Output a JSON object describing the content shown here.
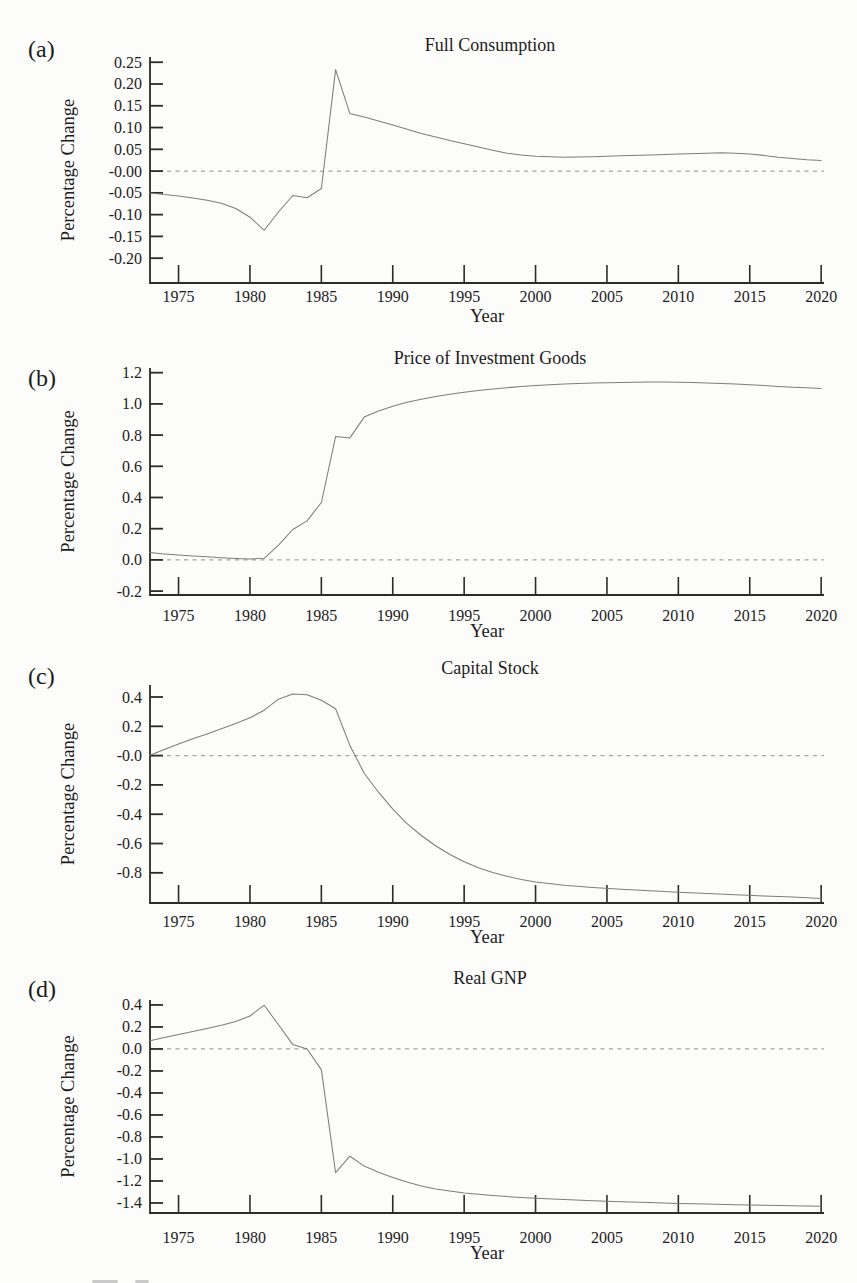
{
  "page": {
    "colors": {
      "paper": "#fcfcfb",
      "ink": "#1c1c1c",
      "axis": "#2b2b2b",
      "curve": "#7d7d7d",
      "dashed": "#a3a3a3"
    }
  },
  "chart_data": [
    {
      "type": "line",
      "id": "a",
      "panel_label": "(a)",
      "title": "Full Consumption",
      "xlabel": "Year",
      "ylabel": "Percentage Change",
      "xlim": [
        1973,
        2020.2
      ],
      "ylim": [
        -0.257,
        0.262
      ],
      "grid": false,
      "legend": false,
      "zero_dashed_line": true,
      "xticks": [
        1975,
        1980,
        1985,
        1990,
        1995,
        2000,
        2005,
        2010,
        2015,
        2020
      ],
      "xtick_labels": [
        "1975",
        "1980",
        "1985",
        "1990",
        "1995",
        "2000",
        "2005",
        "2010",
        "2015",
        "2020"
      ],
      "ytick_values": [
        0.25,
        0.2,
        0.15,
        0.1,
        0.05,
        0.0,
        -0.05,
        -0.1,
        -0.15,
        -0.2
      ],
      "ytick_labels": [
        "0.25",
        "0.20",
        "0.15",
        "0.10",
        "0.05",
        "-0.00",
        "-0.05",
        "-0.10",
        "-0.15",
        "-0.20"
      ],
      "series": [
        {
          "name": "Full Consumption",
          "points": [
            [
              1973,
              -0.05
            ],
            [
              1974,
              -0.054
            ],
            [
              1975,
              -0.057
            ],
            [
              1976,
              -0.062
            ],
            [
              1977,
              -0.067
            ],
            [
              1978,
              -0.074
            ],
            [
              1979,
              -0.086
            ],
            [
              1980,
              -0.106
            ],
            [
              1981,
              -0.136
            ],
            [
              1982,
              -0.094
            ],
            [
              1983,
              -0.056
            ],
            [
              1984,
              -0.061
            ],
            [
              1985,
              -0.04
            ],
            [
              1986,
              0.233
            ],
            [
              1987,
              0.132
            ],
            [
              1988,
              0.124
            ],
            [
              1989,
              0.115
            ],
            [
              1990,
              0.106
            ],
            [
              1991,
              0.096
            ],
            [
              1992,
              0.086
            ],
            [
              1993,
              0.078
            ],
            [
              1994,
              0.07
            ],
            [
              1995,
              0.063
            ],
            [
              1996,
              0.055
            ],
            [
              1997,
              0.048
            ],
            [
              1998,
              0.041
            ],
            [
              1999,
              0.037
            ],
            [
              2000,
              0.034
            ],
            [
              2002,
              0.032
            ],
            [
              2004,
              0.033
            ],
            [
              2006,
              0.035
            ],
            [
              2008,
              0.037
            ],
            [
              2010,
              0.039
            ],
            [
              2012,
              0.041
            ],
            [
              2013,
              0.042
            ],
            [
              2014,
              0.041
            ],
            [
              2015,
              0.039
            ],
            [
              2016,
              0.036
            ],
            [
              2017,
              0.032
            ],
            [
              2018,
              0.029
            ],
            [
              2019,
              0.026
            ],
            [
              2020,
              0.024
            ]
          ]
        }
      ]
    },
    {
      "type": "line",
      "id": "b",
      "panel_label": "(b)",
      "title": "Price of Investment Goods",
      "xlabel": "Year",
      "ylabel": "Percentage Change",
      "xlim": [
        1973,
        2020.2
      ],
      "ylim": [
        -0.225,
        1.23
      ],
      "grid": false,
      "legend": false,
      "zero_dashed_line": true,
      "xticks": [
        1975,
        1980,
        1985,
        1990,
        1995,
        2000,
        2005,
        2010,
        2015,
        2020
      ],
      "xtick_labels": [
        "1975",
        "1980",
        "1985",
        "1990",
        "1995",
        "2000",
        "2005",
        "2010",
        "2015",
        "2020"
      ],
      "ytick_values": [
        1.2,
        1.0,
        0.8,
        0.6,
        0.4,
        0.2,
        0.0,
        -0.2
      ],
      "ytick_labels": [
        "1.2",
        "1.0",
        "0.8",
        "0.6",
        "0.4",
        "0.2",
        "0.0",
        "-0.2"
      ],
      "series": [
        {
          "name": "Price of Investment Goods",
          "points": [
            [
              1973,
              0.047
            ],
            [
              1974,
              0.038
            ],
            [
              1975,
              0.031
            ],
            [
              1976,
              0.025
            ],
            [
              1977,
              0.02
            ],
            [
              1978,
              0.014
            ],
            [
              1979,
              0.009
            ],
            [
              1980,
              0.006
            ],
            [
              1981,
              0.01
            ],
            [
              1982,
              0.095
            ],
            [
              1983,
              0.195
            ],
            [
              1984,
              0.25
            ],
            [
              1985,
              0.368
            ],
            [
              1986,
              0.79
            ],
            [
              1987,
              0.782
            ],
            [
              1988,
              0.915
            ],
            [
              1989,
              0.955
            ],
            [
              1990,
              0.985
            ],
            [
              1991,
              1.01
            ],
            [
              1992,
              1.03
            ],
            [
              1993,
              1.048
            ],
            [
              1994,
              1.062
            ],
            [
              1995,
              1.075
            ],
            [
              1996,
              1.086
            ],
            [
              1997,
              1.096
            ],
            [
              1998,
              1.104
            ],
            [
              1999,
              1.111
            ],
            [
              2000,
              1.117
            ],
            [
              2001,
              1.122
            ],
            [
              2002,
              1.127
            ],
            [
              2003,
              1.131
            ],
            [
              2004,
              1.134
            ],
            [
              2005,
              1.136
            ],
            [
              2006,
              1.138
            ],
            [
              2007,
              1.139
            ],
            [
              2008,
              1.14
            ],
            [
              2009,
              1.14
            ],
            [
              2010,
              1.139
            ],
            [
              2011,
              1.137
            ],
            [
              2012,
              1.134
            ],
            [
              2013,
              1.131
            ],
            [
              2014,
              1.127
            ],
            [
              2015,
              1.122
            ],
            [
              2016,
              1.117
            ],
            [
              2017,
              1.112
            ],
            [
              2018,
              1.107
            ],
            [
              2019,
              1.103
            ],
            [
              2020,
              1.099
            ]
          ]
        }
      ]
    },
    {
      "type": "line",
      "id": "c",
      "panel_label": "(c)",
      "title": "Capital Stock",
      "xlabel": "Year",
      "ylabel": "Percentage Change",
      "xlim": [
        1973,
        2020.2
      ],
      "ylim": [
        -1.006,
        0.482
      ],
      "grid": false,
      "legend": false,
      "zero_dashed_line": true,
      "xticks": [
        1975,
        1980,
        1985,
        1990,
        1995,
        2000,
        2005,
        2010,
        2015,
        2020
      ],
      "xtick_labels": [
        "1975",
        "1980",
        "1985",
        "1990",
        "1995",
        "2000",
        "2005",
        "2010",
        "2015",
        "2020"
      ],
      "ytick_values": [
        0.4,
        0.2,
        0.0,
        -0.2,
        -0.4,
        -0.6,
        -0.8
      ],
      "ytick_labels": [
        "0.4",
        "0.2",
        "-0.0",
        "-0.2",
        "-0.4",
        "-0.6",
        "-0.8"
      ],
      "series": [
        {
          "name": "Capital Stock",
          "points": [
            [
              1973,
              0.003
            ],
            [
              1974,
              0.042
            ],
            [
              1975,
              0.08
            ],
            [
              1976,
              0.115
            ],
            [
              1977,
              0.148
            ],
            [
              1978,
              0.183
            ],
            [
              1979,
              0.22
            ],
            [
              1980,
              0.258
            ],
            [
              1981,
              0.31
            ],
            [
              1982,
              0.385
            ],
            [
              1983,
              0.42
            ],
            [
              1984,
              0.415
            ],
            [
              1985,
              0.378
            ],
            [
              1986,
              0.32
            ],
            [
              1987,
              0.07
            ],
            [
              1988,
              -0.12
            ],
            [
              1989,
              -0.25
            ],
            [
              1990,
              -0.365
            ],
            [
              1991,
              -0.465
            ],
            [
              1992,
              -0.545
            ],
            [
              1993,
              -0.615
            ],
            [
              1994,
              -0.675
            ],
            [
              1995,
              -0.725
            ],
            [
              1996,
              -0.765
            ],
            [
              1997,
              -0.798
            ],
            [
              1998,
              -0.824
            ],
            [
              1999,
              -0.845
            ],
            [
              2000,
              -0.862
            ],
            [
              2002,
              -0.885
            ],
            [
              2004,
              -0.9
            ],
            [
              2006,
              -0.912
            ],
            [
              2008,
              -0.922
            ],
            [
              2010,
              -0.932
            ],
            [
              2012,
              -0.941
            ],
            [
              2014,
              -0.95
            ],
            [
              2016,
              -0.958
            ],
            [
              2018,
              -0.966
            ],
            [
              2020,
              -0.975
            ]
          ]
        }
      ]
    },
    {
      "type": "line",
      "id": "d",
      "panel_label": "(d)",
      "title": "Real GNP",
      "xlabel": "Year",
      "ylabel": "Percentage Change",
      "xlim": [
        1973,
        2020.2
      ],
      "ylim": [
        -1.491,
        0.445
      ],
      "grid": false,
      "legend": false,
      "zero_dashed_line": true,
      "xticks": [
        1975,
        1980,
        1985,
        1990,
        1995,
        2000,
        2005,
        2010,
        2015,
        2020
      ],
      "xtick_labels": [
        "1975",
        "1980",
        "1985",
        "1990",
        "1995",
        "2000",
        "2005",
        "2010",
        "2015",
        "2020"
      ],
      "ytick_values": [
        0.4,
        0.2,
        0.0,
        -0.2,
        -0.4,
        -0.6,
        -0.8,
        -1.0,
        -1.2,
        -1.4
      ],
      "ytick_labels": [
        "0.4",
        "0.2",
        "0.0",
        "-0.2",
        "-0.4",
        "-0.6",
        "-0.8",
        "-1.0",
        "-1.2",
        "-1.4"
      ],
      "series": [
        {
          "name": "Real GNP",
          "points": [
            [
              1973,
              0.075
            ],
            [
              1974,
              0.105
            ],
            [
              1975,
              0.132
            ],
            [
              1976,
              0.158
            ],
            [
              1977,
              0.185
            ],
            [
              1978,
              0.215
            ],
            [
              1979,
              0.25
            ],
            [
              1980,
              0.3
            ],
            [
              1981,
              0.398
            ],
            [
              1982,
              0.22
            ],
            [
              1983,
              0.04
            ],
            [
              1984,
              0.0
            ],
            [
              1985,
              -0.19
            ],
            [
              1986,
              -1.125
            ],
            [
              1987,
              -0.975
            ],
            [
              1988,
              -1.065
            ],
            [
              1989,
              -1.12
            ],
            [
              1990,
              -1.168
            ],
            [
              1991,
              -1.21
            ],
            [
              1992,
              -1.245
            ],
            [
              1993,
              -1.272
            ],
            [
              1994,
              -1.292
            ],
            [
              1995,
              -1.308
            ],
            [
              1996,
              -1.321
            ],
            [
              1997,
              -1.332
            ],
            [
              1998,
              -1.342
            ],
            [
              1999,
              -1.35
            ],
            [
              2000,
              -1.357
            ],
            [
              2002,
              -1.369
            ],
            [
              2004,
              -1.379
            ],
            [
              2006,
              -1.388
            ],
            [
              2008,
              -1.396
            ],
            [
              2010,
              -1.404
            ],
            [
              2012,
              -1.41
            ],
            [
              2014,
              -1.416
            ],
            [
              2016,
              -1.421
            ],
            [
              2018,
              -1.426
            ],
            [
              2020,
              -1.43
            ]
          ]
        }
      ]
    }
  ]
}
